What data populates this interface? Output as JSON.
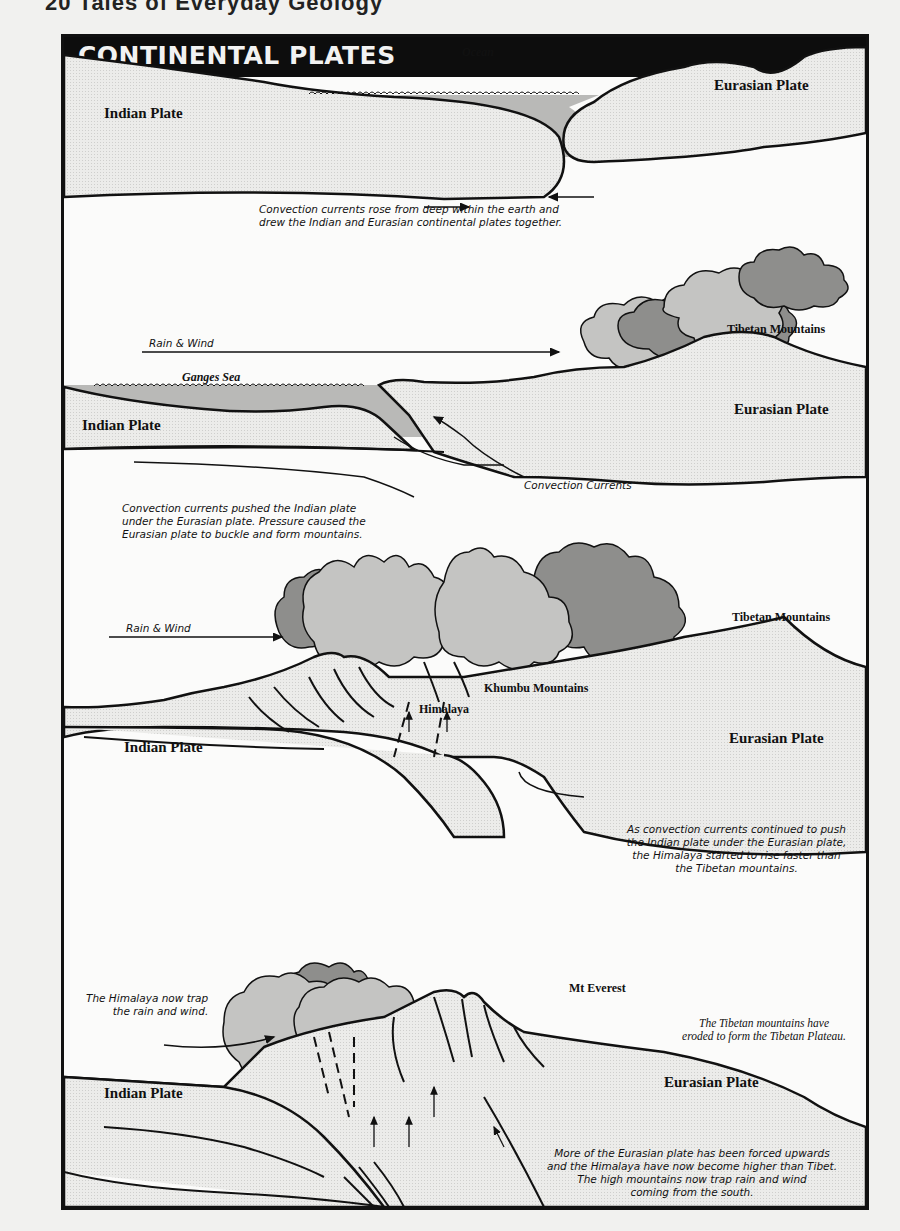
{
  "page_header": "20  Tales of Everyday Geology",
  "title": "CONTINENTAL PLATES",
  "colors": {
    "plate_fill": "#e9e9e7",
    "water_fill": "#b9b9b7",
    "cloud_light": "#c4c4c2",
    "cloud_dark": "#8e8e8c",
    "title_bar": "#0d0d0d"
  },
  "panels": [
    {
      "labels": {
        "ocean": "Ocean",
        "indian_plate": "Indian Plate",
        "eurasian_plate": "Eurasian Plate"
      },
      "caption": [
        "Convection currents rose from deep within the earth and",
        "drew the Indian and Eurasian continental plates together."
      ]
    },
    {
      "labels": {
        "rain_wind": "Rain & Wind",
        "tibetan_mountains": "Tibetan Mountains",
        "ganges_sea": "Ganges Sea",
        "indian_plate": "Indian Plate",
        "eurasian_plate": "Eurasian Plate",
        "convection_currents": "Convection Currents"
      },
      "caption": [
        "Convection currents pushed the Indian plate",
        "under the Eurasian plate. Pressure caused the",
        "Eurasian plate to buckle and form mountains."
      ]
    },
    {
      "labels": {
        "rain_wind": "Rain & Wind",
        "tibetan_mountains": "Tibetan Mountains",
        "khumbu_mountains": "Khumbu Mountains",
        "himalaya": "Himalaya",
        "indian_plate": "Indian Plate",
        "eurasian_plate": "Eurasian Plate"
      },
      "caption": [
        "As convection currents continued to push",
        "the Indian plate under the Eurasian plate,",
        "the Himalaya started to rise faster than",
        "the Tibetan mountains."
      ]
    },
    {
      "labels": {
        "trap_note": [
          "The Himalaya now trap",
          "the rain and wind."
        ],
        "mt_everest": "Mt Everest",
        "tibetan_note": [
          "The Tibetan mountains have",
          "eroded to form the Tibetan Plateau."
        ],
        "indian_plate": "Indian Plate",
        "eurasian_plate": "Eurasian Plate"
      },
      "caption": [
        "More of the Eurasian plate has been forced upwards",
        "and the Himalaya have now become higher than Tibet.",
        "The high mountains now trap rain and wind",
        "coming from the south."
      ]
    }
  ]
}
